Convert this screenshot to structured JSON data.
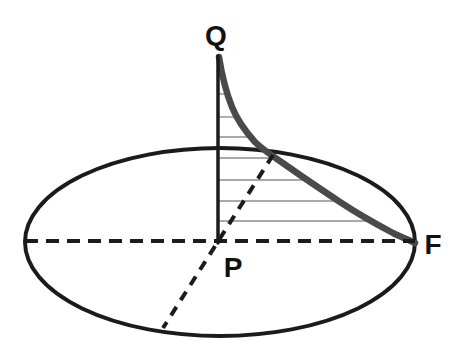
{
  "figure": {
    "labels": {
      "q": "Q",
      "p": "P",
      "f": "F"
    },
    "colors": {
      "outline": "#1b1b1b",
      "curve": "#4a4a4a",
      "hatch": "#8c8c8c",
      "label": "#111111"
    }
  }
}
